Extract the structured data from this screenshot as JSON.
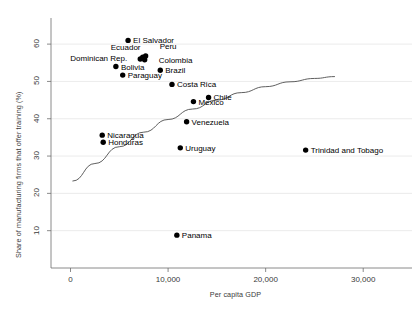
{
  "chart_data": {
    "type": "scatter",
    "title": "",
    "xlabel": "Per capita GDP",
    "ylabel": "Share of manufacturing firms that offer training (%)",
    "xlim": [
      -2000,
      35000
    ],
    "ylim": [
      0,
      67
    ],
    "xticks": [
      0,
      10000,
      20000,
      30000
    ],
    "xticklabels": [
      "0",
      "10,000",
      "20,000",
      "30,000"
    ],
    "yticks": [
      10,
      20,
      30,
      40,
      50,
      60
    ],
    "yticklabels": [
      "10",
      "20",
      "30",
      "40",
      "50",
      "60"
    ],
    "grid": "horizontal",
    "legend": "none",
    "marker_color": "#000000",
    "fit_line_color": "#4d4d4d",
    "points": [
      {
        "name": "El Salvador",
        "x": 5900,
        "y": 61.0,
        "label_dx": 5,
        "label_dy": -4,
        "anchor": "start"
      },
      {
        "name": "Ecuador",
        "x": 7400,
        "y": 56.5,
        "label_dx": -32,
        "label_dy": -14,
        "anchor": "start"
      },
      {
        "name": "Dominican Rep.",
        "x": 7150,
        "y": 56.0,
        "label_dx": -70,
        "label_dy": -5,
        "anchor": "start"
      },
      {
        "name": "Peru",
        "x": 7700,
        "y": 56.8,
        "label_dx": 14,
        "label_dy": -14,
        "anchor": "start"
      },
      {
        "name": "Colombia",
        "x": 7600,
        "y": 55.8,
        "label_dx": 14,
        "label_dy": -4,
        "anchor": "start"
      },
      {
        "name": "Bolivia",
        "x": 4650,
        "y": 54.0,
        "label_dx": 5,
        "label_dy": -4,
        "anchor": "start"
      },
      {
        "name": "Paraguay",
        "x": 5350,
        "y": 51.7,
        "label_dx": 5,
        "label_dy": -4,
        "anchor": "start"
      },
      {
        "name": "Brazil",
        "x": 9200,
        "y": 53.0,
        "label_dx": 5,
        "label_dy": -4,
        "anchor": "start"
      },
      {
        "name": "Costa Rica",
        "x": 10400,
        "y": 49.2,
        "label_dx": 5,
        "label_dy": -4,
        "anchor": "start"
      },
      {
        "name": "Chile",
        "x": 14150,
        "y": 45.7,
        "label_dx": 5,
        "label_dy": -4,
        "anchor": "start"
      },
      {
        "name": "Mexico",
        "x": 12600,
        "y": 44.6,
        "label_dx": 5,
        "label_dy": -4,
        "anchor": "start"
      },
      {
        "name": "Venezuela",
        "x": 11900,
        "y": 39.2,
        "label_dx": 5,
        "label_dy": -4,
        "anchor": "start"
      },
      {
        "name": "Nicaragua",
        "x": 3250,
        "y": 35.6,
        "label_dx": 5,
        "label_dy": -4,
        "anchor": "start"
      },
      {
        "name": "Honduras",
        "x": 3350,
        "y": 33.7,
        "label_dx": 5,
        "label_dy": -4,
        "anchor": "start"
      },
      {
        "name": "Uruguay",
        "x": 11250,
        "y": 32.2,
        "label_dx": 5,
        "label_dy": -4,
        "anchor": "start"
      },
      {
        "name": "Trinidad and Tobago",
        "x": 24100,
        "y": 31.6,
        "label_dx": 5,
        "label_dy": -4,
        "anchor": "start"
      },
      {
        "name": "Panama",
        "x": 10900,
        "y": 8.8,
        "label_dx": 5,
        "label_dy": -4,
        "anchor": "start"
      }
    ],
    "fit_curve": [
      {
        "x": 200,
        "y": 23.3
      },
      {
        "x": 2500,
        "y": 28.0
      },
      {
        "x": 5000,
        "y": 32.5
      },
      {
        "x": 7500,
        "y": 36.4
      },
      {
        "x": 10000,
        "y": 39.8
      },
      {
        "x": 12500,
        "y": 42.6
      },
      {
        "x": 15000,
        "y": 45.0
      },
      {
        "x": 17500,
        "y": 47.0
      },
      {
        "x": 20000,
        "y": 48.6
      },
      {
        "x": 22500,
        "y": 49.9
      },
      {
        "x": 25000,
        "y": 50.8
      },
      {
        "x": 27100,
        "y": 51.3
      }
    ]
  }
}
